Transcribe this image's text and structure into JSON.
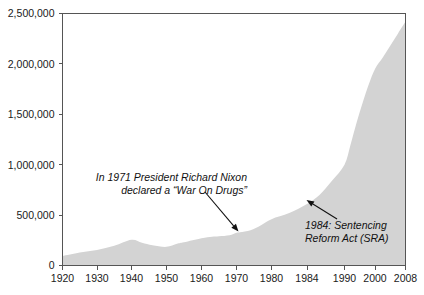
{
  "chart_data": {
    "type": "area",
    "title": "",
    "subtitle": "",
    "xlabel": "",
    "ylabel": "",
    "grid": false,
    "legend": "none",
    "fill_color": "#d3d3d3",
    "axis_color": "#555555",
    "text_color": "#1a1a1a",
    "xlim": [
      1920,
      2008
    ],
    "ylim": [
      0,
      2500000
    ],
    "y_ticks": [
      0,
      500000,
      1000000,
      1500000,
      2000000,
      2500000
    ],
    "y_tick_labels": [
      "0",
      "500,000",
      "1,000,000",
      "1,500,000",
      "2,000,000",
      "2,500,000"
    ],
    "x_ticks": [
      1920,
      1930,
      1940,
      1950,
      1960,
      1970,
      1980,
      1984,
      1990,
      2000,
      2008
    ],
    "x_tick_labels": [
      "1920",
      "1930",
      "1940",
      "1950",
      "1960",
      "1970",
      "1980",
      "1984",
      "1990",
      "2000",
      "2008"
    ],
    "x_axis_note": "non-uniform spacing: 1984 tick inserted between 1980 and 1990",
    "x": [
      1920,
      1925,
      1930,
      1935,
      1940,
      1943,
      1946,
      1950,
      1953,
      1955,
      1960,
      1963,
      1965,
      1968,
      1970,
      1971,
      1974,
      1977,
      1980,
      1982,
      1984,
      1986,
      1988,
      1990,
      1992,
      1994,
      1996,
      1998,
      2000,
      2002,
      2004,
      2006,
      2008
    ],
    "values": [
      95000,
      130000,
      155000,
      195000,
      255000,
      225000,
      200000,
      185000,
      215000,
      230000,
      270000,
      285000,
      290000,
      300000,
      325000,
      330000,
      350000,
      400000,
      460000,
      520000,
      610000,
      700000,
      840000,
      1000000,
      1200000,
      1420000,
      1620000,
      1800000,
      1950000,
      2060000,
      2180000,
      2300000,
      2420000
    ],
    "annotations": [
      {
        "id": "nixon",
        "lines": [
          "In 1971 President Richard Nixon",
          "declared a “War On Drugs”"
        ],
        "target_x": 1971,
        "target_y": 330000,
        "arrow": "down-right"
      },
      {
        "id": "sra",
        "lines": [
          "1984: Sentencing",
          "Reform Act (SRA)"
        ],
        "target_x": 1984,
        "target_y": 610000,
        "arrow": "up-left"
      }
    ]
  }
}
